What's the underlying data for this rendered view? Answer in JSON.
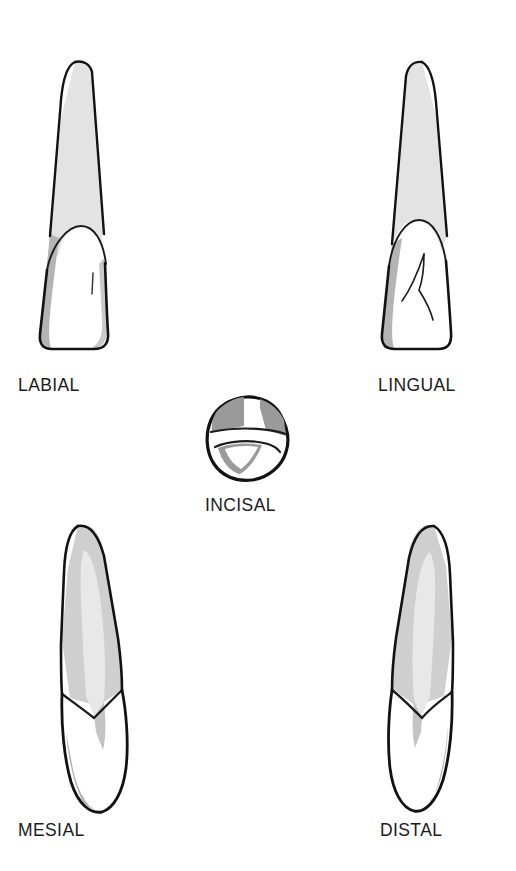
{
  "figure": {
    "title": "",
    "background_color": "#ffffff",
    "style": "line-art illustration with halftone gray shading",
    "view_count": 5
  },
  "palette": {
    "outline": "#121212",
    "detail_line": "#1b1b1b",
    "enamel_white": "#ffffff",
    "root_light_gray": "#e3e3e3",
    "shadow_mid_gray": "#b4b4b4",
    "shadow_dark_gray": "#9a9a9a",
    "text": "#1b1b1b"
  },
  "views": [
    {
      "id": "labial",
      "label": "LABIAL",
      "row": "top",
      "column": "left",
      "caption_position": "below"
    },
    {
      "id": "lingual",
      "label": "LINGUAL",
      "row": "top",
      "column": "right",
      "caption_position": "below"
    },
    {
      "id": "incisal",
      "label": "INCISAL",
      "row": "middle",
      "column": "center",
      "caption_position": "below"
    },
    {
      "id": "mesial",
      "label": "MESIAL",
      "row": "bottom",
      "column": "left",
      "caption_position": "below"
    },
    {
      "id": "distal",
      "label": "DISTAL",
      "row": "bottom",
      "column": "right",
      "caption_position": "below"
    }
  ]
}
